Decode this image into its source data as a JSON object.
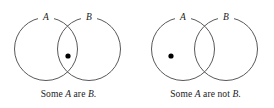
{
  "figure": {
    "background_color": "#ffffff",
    "stroke_color": "#595959",
    "dot_color": "#000000",
    "text_color": "#1a1a1a",
    "panels": [
      {
        "id": "some-a-are-b",
        "caption_full": "Some A are B.",
        "caption_parts": {
          "lead": "Some ",
          "subject": "A",
          "copula": " are ",
          "predicate": "B",
          "period": "."
        },
        "left_circle": {
          "label": "A",
          "cx": 46,
          "cy": 49,
          "r": 31.5
        },
        "right_circle": {
          "label": "B",
          "cx": 89,
          "cy": 49,
          "r": 31.5
        },
        "dot": {
          "cx": 68,
          "cy": 56,
          "r": 2.6,
          "region": "intersection"
        }
      },
      {
        "id": "some-a-are-not-b",
        "caption_full": "Some A are not B.",
        "caption_parts": {
          "lead": "Some ",
          "subject": "A",
          "copula": " are not ",
          "predicate": "B",
          "period": "."
        },
        "left_circle": {
          "label": "A",
          "cx": 46,
          "cy": 49,
          "r": 31.5
        },
        "right_circle": {
          "label": "B",
          "cx": 89,
          "cy": 49,
          "r": 31.5
        },
        "dot": {
          "cx": 34,
          "cy": 56,
          "r": 2.6,
          "region": "left-only"
        }
      }
    ]
  }
}
